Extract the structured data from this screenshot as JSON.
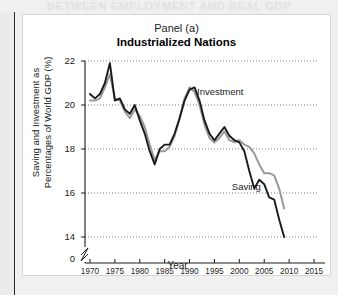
{
  "page": {
    "running_header": "BETWEEN EMPLOYMENT AND REAL GDP",
    "spine_icon": "page-spine"
  },
  "figure": {
    "panel_label": "Panel (a)",
    "panel_title": "Industrialized Nations"
  },
  "chart_data": {
    "type": "line",
    "title": "Industrialized Nations",
    "subtitle": "Panel (a)",
    "xlabel": "Year",
    "ylabel": "Saving and Investment as Percentages of World GDP (%)",
    "xlim": [
      1969,
      2016
    ],
    "ylim": [
      13.2,
      22.2
    ],
    "yticks": [
      22,
      20,
      18,
      16,
      14
    ],
    "ytick_labels": [
      "22",
      "20",
      "18",
      "16",
      "14"
    ],
    "y_axis_break": true,
    "y_origin_label": "0",
    "xticks": [
      1970,
      1975,
      1980,
      1985,
      1990,
      1995,
      2000,
      2005,
      2010,
      2015
    ],
    "xtick_labels": [
      "1970",
      "1975",
      "1980",
      "1985",
      "1990",
      "1995",
      "2000",
      "2005",
      "2010",
      "2015"
    ],
    "grid": "horizontal-dotted",
    "legend": "inline-annotations",
    "annotations": [
      {
        "text": "Investment",
        "x": 1991.5,
        "y": 20.45
      },
      {
        "text": "Saving",
        "x": 1998.5,
        "y": 16.15
      }
    ],
    "series": [
      {
        "name": "Saving",
        "color": "#1a1a1a",
        "x": [
          1970,
          1971,
          1972,
          1973,
          1974,
          1975,
          1976,
          1977,
          1978,
          1979,
          1980,
          1981,
          1982,
          1983,
          1984,
          1985,
          1986,
          1987,
          1988,
          1989,
          1990,
          1991,
          1992,
          1993,
          1994,
          1995,
          1996,
          1997,
          1998,
          1999,
          2000,
          2001,
          2002,
          2003,
          2004,
          2005,
          2006,
          2007,
          2008,
          2009
        ],
        "values": [
          20.5,
          20.3,
          20.5,
          21.0,
          21.9,
          20.2,
          20.3,
          19.8,
          19.6,
          20.0,
          19.3,
          18.7,
          17.9,
          17.3,
          18.0,
          18.2,
          18.2,
          18.7,
          19.4,
          20.2,
          20.7,
          20.8,
          20.2,
          19.3,
          18.7,
          18.4,
          18.7,
          19.0,
          18.6,
          18.4,
          18.3,
          17.9,
          17.0,
          16.2,
          16.6,
          16.4,
          15.8,
          15.7,
          14.8,
          14.0
        ]
      },
      {
        "name": "Investment",
        "color": "#9a9a9a",
        "x": [
          1970,
          1971,
          1972,
          1973,
          1974,
          1975,
          1976,
          1977,
          1978,
          1979,
          1980,
          1981,
          1982,
          1983,
          1984,
          1985,
          1986,
          1987,
          1988,
          1989,
          1990,
          1991,
          1992,
          1993,
          1994,
          1995,
          1996,
          1997,
          1998,
          1999,
          2000,
          2001,
          2002,
          2003,
          2004,
          2005,
          2006,
          2007,
          2008,
          2009
        ],
        "values": [
          20.2,
          20.2,
          20.3,
          20.8,
          21.4,
          20.3,
          20.2,
          19.7,
          19.4,
          19.8,
          19.5,
          19.0,
          18.2,
          17.5,
          17.9,
          17.9,
          18.1,
          18.6,
          19.4,
          20.3,
          20.8,
          20.6,
          20.0,
          19.1,
          18.5,
          18.3,
          18.5,
          18.8,
          18.4,
          18.3,
          18.4,
          18.2,
          18.1,
          17.8,
          17.3,
          16.9,
          16.9,
          16.8,
          16.2,
          15.3
        ]
      }
    ]
  }
}
